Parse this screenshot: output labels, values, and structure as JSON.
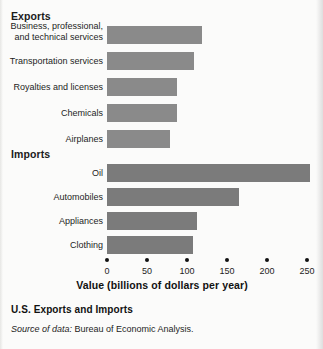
{
  "chart_data": {
    "type": "bar",
    "orientation": "horizontal",
    "title": "U.S. Exports and Imports",
    "xlabel": "Value (billions of dollars per year)",
    "ylabel": "",
    "xlim": [
      0,
      260
    ],
    "xticks": [
      0,
      50,
      100,
      150,
      200,
      250
    ],
    "xtick_labels": [
      "0",
      "50",
      "100",
      "150",
      "200",
      "250"
    ],
    "grid": false,
    "legend": false,
    "groups": [
      {
        "name": "Exports",
        "color": "#8a8a8a",
        "categories": [
          "Business, professional,\nand technical services",
          "Transportation services",
          "Royalties and licenses",
          "Chemicals",
          "Airplanes"
        ],
        "values": [
          119,
          109,
          88,
          88,
          79
        ]
      },
      {
        "name": "Imports",
        "color": "#7b7b7b",
        "categories": [
          "Oil",
          "Automobiles",
          "Appliances",
          "Clothing"
        ],
        "values": [
          254,
          165,
          112,
          107
        ]
      }
    ],
    "source_note_italic": "Source of data:",
    "source_note_text": " Bureau of Economic Analysis."
  },
  "headings": {
    "exports": "Exports",
    "imports": "Imports"
  },
  "labels": {
    "export_0": "Business, professional,\nand technical services",
    "export_1": "Transportation services",
    "export_2": "Royalties and licenses",
    "export_3": "Chemicals",
    "export_4": "Airplanes",
    "import_0": "Oil",
    "import_1": "Automobiles",
    "import_2": "Appliances",
    "import_3": "Clothing"
  },
  "axis": {
    "tick_0": "0",
    "tick_1": "50",
    "tick_2": "100",
    "tick_3": "150",
    "tick_4": "200",
    "tick_5": "250",
    "title": "Value (billions of dollars per year)"
  },
  "footer": {
    "caption": "U.S. Exports and Imports",
    "source_label": "Source of data:",
    "source_value": "Bureau of Economic Analysis."
  }
}
